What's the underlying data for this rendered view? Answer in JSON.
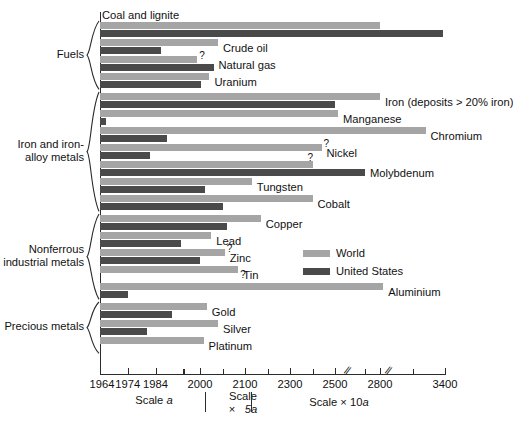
{
  "chart_data": {
    "type": "bar",
    "orientation": "horizontal",
    "title": "",
    "subtitle": "",
    "xlabel": "",
    "ylabel": "",
    "grid": false,
    "legend_position": "center-right",
    "axis_note": "Piecewise x-axis: 'Scale a' from 1964 to 2000, 'Scale x 5a' from 2000 to 2100, 'Scale x 10a' from 2100 to 3400, with two axis breaks near 2600 and 2900",
    "x_axis": {
      "tick_labels": [
        "1964",
        "1974",
        "1984",
        "2000",
        "2100",
        "2300",
        "2500",
        "2800",
        "3400"
      ],
      "tick_values": [
        1964,
        1974,
        1984,
        2000,
        2100,
        2300,
        2500,
        2800,
        3400
      ],
      "minor_ticks": [
        1994,
        2050,
        2200,
        2400,
        2700,
        3100
      ],
      "breaks": [
        2600,
        2900
      ]
    },
    "scale_captions": [
      {
        "text_prefix": "Scale ",
        "text_italic": "a",
        "text_suffix": ""
      },
      {
        "text_prefix": "Scale\n×   ",
        "text_italic": "5a",
        "text_suffix": ""
      },
      {
        "text_prefix": "Scale × 10",
        "text_italic": "a",
        "text_suffix": ""
      }
    ],
    "series": [
      {
        "name": "World",
        "color": "#a5a5a5"
      },
      {
        "name": "United States",
        "color": "#4a4a4a"
      }
    ],
    "groups": [
      {
        "label": "Fuels",
        "items": [
          {
            "label": "Coal and lignite",
            "label_above": true,
            "world": 2800,
            "us": 3380,
            "world_q": false,
            "us_q": false
          },
          {
            "label": "Crude oil",
            "label_above": false,
            "world": 2040,
            "us": 1986,
            "world_q": false,
            "us_q": false
          },
          {
            "label": "Natural gas",
            "label_above": false,
            "world": 1999,
            "us": 2030,
            "world_q": true,
            "us_q": false
          },
          {
            "label": "Uranium",
            "label_above": false,
            "world": 2021,
            "us": 2003,
            "world_q": false,
            "us_q": false
          }
        ]
      },
      {
        "label": "Iron and iron-\nalloy metals",
        "items": [
          {
            "label": "Iron (deposits > 20% iron)",
            "label_above": false,
            "world": 2800,
            "us": 2500,
            "world_q": false,
            "us_q": false
          },
          {
            "label": "Manganese",
            "label_above": false,
            "world": 2520,
            "us": 1966,
            "world_q": false,
            "us_q": false
          },
          {
            "label": "Chromium",
            "label_above": false,
            "world": 3220,
            "us": 1988,
            "world_q": false,
            "us_q": false
          },
          {
            "label": "Nickel",
            "label_above": false,
            "world": 2440,
            "us": 1982,
            "world_q": true,
            "us_q": false
          },
          {
            "label": "Molybdenum",
            "label_above": false,
            "world": 2400,
            "us": 2700,
            "world_q": true,
            "us_q": false
          },
          {
            "label": "Tungsten",
            "label_above": false,
            "world": 2130,
            "us": 2012,
            "world_q": false,
            "us_q": false
          },
          {
            "label": "Cobalt",
            "label_above": false,
            "world": 2400,
            "us": 2050,
            "world_q": false,
            "us_q": false
          }
        ]
      },
      {
        "label": "Nonferrous\nindustrial metals",
        "items": [
          {
            "label": "Copper",
            "label_above": false,
            "world": 2170,
            "us": 2060,
            "world_q": false,
            "us_q": false
          },
          {
            "label": "Lead",
            "label_above": false,
            "world": 2025,
            "us": 1993,
            "world_q": false,
            "us_q": false
          },
          {
            "label": "Zinc",
            "label_above": false,
            "world": 2055,
            "us": 2000,
            "world_q": true,
            "us_q": false
          },
          {
            "label": "Tin",
            "label_above": false,
            "world": 2085,
            "us": 0,
            "world_q": true,
            "us_q": false
          },
          {
            "label": "Aluminium",
            "label_above": false,
            "world": 2830,
            "us": 1974,
            "world_q": false,
            "us_q": false
          }
        ]
      },
      {
        "label": "Precious metals",
        "items": [
          {
            "label": "Gold",
            "label_above": false,
            "world": 2015,
            "us": 1990,
            "world_q": false,
            "us_q": false
          },
          {
            "label": "Silver",
            "label_above": false,
            "world": 2040,
            "us": 1981,
            "world_q": false,
            "us_q": false
          },
          {
            "label": "Platinum",
            "label_above": false,
            "world": 2008,
            "us": 0,
            "world_q": false,
            "us_q": false
          }
        ]
      }
    ]
  },
  "legend": {
    "items": [
      {
        "label": "World",
        "color": "#a5a5a5"
      },
      {
        "label": "United States",
        "color": "#4a4a4a"
      }
    ]
  }
}
